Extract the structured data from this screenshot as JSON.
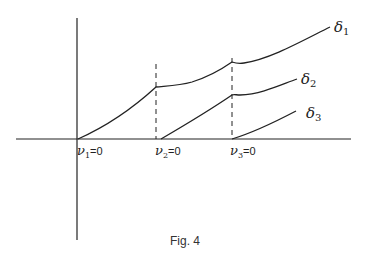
{
  "figure": {
    "caption": "Fig. 4",
    "curves": [
      {
        "name": "δ1",
        "label_main": "δ",
        "label_sub": "1"
      },
      {
        "name": "δ2",
        "label_main": "δ",
        "label_sub": "2"
      },
      {
        "name": "δ3",
        "label_main": "δ",
        "label_sub": "3"
      }
    ],
    "thresholds": [
      {
        "label_main": "ν",
        "label_sub": "1",
        "label_rest": "=0"
      },
      {
        "label_main": "ν",
        "label_sub": "2",
        "label_rest": "=0"
      },
      {
        "label_main": "ν",
        "label_sub": "3",
        "label_rest": "=0"
      }
    ]
  }
}
